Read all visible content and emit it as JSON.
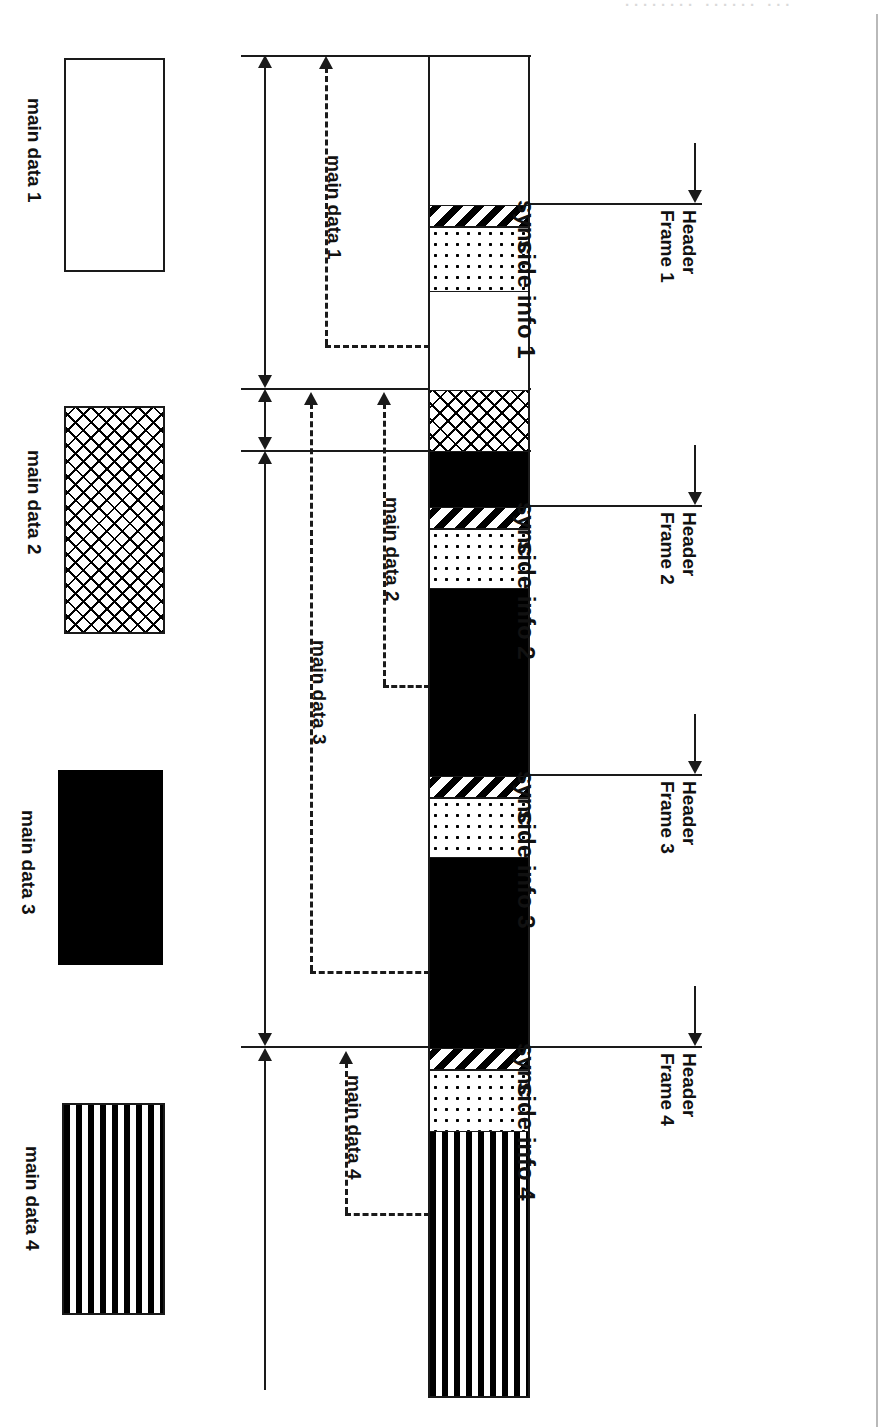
{
  "figure": {
    "kind": "bit-reservoir-frame-diagram",
    "background_color": "#ffffff",
    "ink_color": "#1a1a1a"
  },
  "legend": {
    "items": [
      {
        "label": "main data 1",
        "pattern": "empty",
        "pattern_name": "white / no fill"
      },
      {
        "label": "main data 2",
        "pattern": "cross",
        "pattern_name": "diagonal cross-hatch"
      },
      {
        "label": "main data 3",
        "pattern": "solid",
        "pattern_name": "solid black"
      },
      {
        "label": "main data 4",
        "pattern": "vstripe",
        "pattern_name": "vertical stripes"
      }
    ]
  },
  "span_labels": {
    "items": [
      {
        "label": "main data 1"
      },
      {
        "label": "main data 2"
      },
      {
        "label": "main data 3"
      },
      {
        "label": "main data 4"
      }
    ]
  },
  "bitstream": {
    "segments": [
      {
        "name": "main data 1 (frame 1 payload head)",
        "pattern": "empty"
      },
      {
        "name": "sync 1",
        "pattern": "diag",
        "label": "sync"
      },
      {
        "name": "side info 1",
        "pattern": "dots",
        "label": "side info 1"
      },
      {
        "name": "main data 1 (tail)",
        "pattern": "empty"
      },
      {
        "name": "main data 2 (head)",
        "pattern": "cross"
      },
      {
        "name": "main data 3 (head)",
        "pattern": "solid"
      },
      {
        "name": "sync 2",
        "pattern": "diag",
        "label": "sync"
      },
      {
        "name": "side info 2",
        "pattern": "dots",
        "label": "side info 2"
      },
      {
        "name": "main data 3 (body)",
        "pattern": "solid"
      },
      {
        "name": "sync 3",
        "pattern": "diag",
        "label": "sync"
      },
      {
        "name": "side info 3",
        "pattern": "dots",
        "label": "side info 3"
      },
      {
        "name": "main data 3 (tail)",
        "pattern": "solid"
      },
      {
        "name": "sync 4",
        "pattern": "diag",
        "label": "sync"
      },
      {
        "name": "side info 4",
        "pattern": "dots",
        "label": "side info 4"
      },
      {
        "name": "main data 4",
        "pattern": "vstripe"
      }
    ]
  },
  "sync_labels": {
    "items": [
      {
        "label": "sync"
      },
      {
        "label": "sync"
      },
      {
        "label": "sync"
      },
      {
        "label": "sync"
      }
    ]
  },
  "side_info_labels": {
    "items": [
      {
        "label": "side info 1"
      },
      {
        "label": "side info 2"
      },
      {
        "label": "side info 3"
      },
      {
        "label": "side info 4"
      }
    ]
  },
  "header_markers": {
    "items": [
      {
        "line1": "Header",
        "line2": "Frame 1"
      },
      {
        "line1": "Header",
        "line2": "Frame 2"
      },
      {
        "line1": "Header",
        "line2": "Frame 3"
      },
      {
        "line1": "Header",
        "line2": "Frame 4"
      }
    ]
  },
  "page_artifacts": {
    "top_cropped_text": "········ ······ ···"
  }
}
